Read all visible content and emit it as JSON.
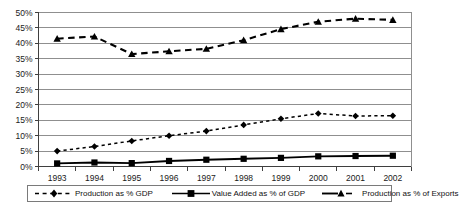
{
  "chart_data": {
    "type": "line",
    "title": "",
    "xlabel": "",
    "ylabel": "",
    "categories": [
      "1993",
      "1994",
      "1995",
      "1996",
      "1997",
      "1998",
      "1999",
      "2000",
      "2001",
      "2002"
    ],
    "ylim": [
      0,
      50
    ],
    "ytick_labels": [
      "0%",
      "5%",
      "10%",
      "15%",
      "20%",
      "25%",
      "30%",
      "35%",
      "40%",
      "45%",
      "50%"
    ],
    "ytick_values": [
      0,
      5,
      10,
      15,
      20,
      25,
      30,
      35,
      40,
      45,
      50
    ],
    "grid": true,
    "legend_position": "bottom",
    "series": [
      {
        "name": "Production as % GDP",
        "marker": "diamond",
        "line_style": "dotted",
        "color": "#000000",
        "values": [
          5.0,
          6.5,
          8.3,
          10.0,
          11.5,
          13.5,
          15.5,
          17.2,
          16.4,
          16.5
        ]
      },
      {
        "name": "Value Added as % of GDP",
        "marker": "square",
        "line_style": "solid",
        "color": "#000000",
        "values": [
          1.0,
          1.3,
          1.1,
          1.8,
          2.2,
          2.5,
          2.8,
          3.3,
          3.4,
          3.5
        ]
      },
      {
        "name": "Production as % of  Exports",
        "marker": "triangle",
        "line_style": "dashed",
        "color": "#000000",
        "values": [
          41.5,
          42.2,
          36.5,
          37.4,
          38.2,
          41.0,
          44.6,
          47.0,
          48.0,
          47.6
        ]
      }
    ]
  },
  "legend": {
    "items": [
      {
        "label": "Production as % GDP"
      },
      {
        "label": "Value Added as % of GDP"
      },
      {
        "label": "Production as % of  Exports"
      }
    ]
  },
  "colors": {
    "axis": "#3f3f3f",
    "grid": "#8f8f8f",
    "series": "#000000",
    "background": "#ffffff",
    "legend_border": "#7a7a7a"
  }
}
